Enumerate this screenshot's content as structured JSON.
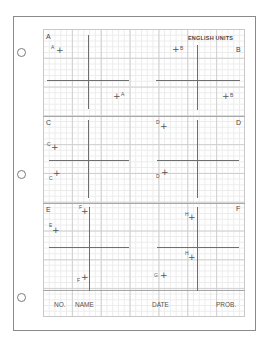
{
  "sheet": {
    "units_label": "ENGLISH UNITS",
    "panels": [
      {
        "id": "A",
        "label": "A",
        "points": [
          {
            "label": "A",
            "side": "left"
          },
          {
            "label": "A",
            "side": "right"
          }
        ]
      },
      {
        "id": "B",
        "label": "B",
        "points": [
          {
            "label": "B",
            "side": "right"
          },
          {
            "label": "B",
            "side": "right"
          }
        ]
      },
      {
        "id": "C",
        "label": "C",
        "points": [
          {
            "label": "C",
            "side": "left"
          },
          {
            "label": "C",
            "side": "left"
          }
        ]
      },
      {
        "id": "D",
        "label": "D",
        "points": [
          {
            "label": "D",
            "side": "left"
          },
          {
            "label": "D",
            "side": "left"
          }
        ]
      },
      {
        "id": "E",
        "label": "E",
        "points": [
          {
            "label": "E",
            "side": "left"
          },
          {
            "label": "F",
            "side": "left"
          },
          {
            "label": "F",
            "side": "left"
          }
        ]
      },
      {
        "id": "F",
        "label": "F",
        "points": [
          {
            "label": "H",
            "side": "left"
          },
          {
            "label": "H",
            "side": "left"
          },
          {
            "label": "G",
            "side": "left"
          }
        ]
      }
    ],
    "footer": {
      "no": "NO.",
      "name": "NAME",
      "date": "DATE",
      "prob": "PROB."
    },
    "colors": {
      "grid_major": "#cfcfcf",
      "grid_minor": "#ececec",
      "axis": "#6e6e6e",
      "border": "#8a8a8a"
    }
  }
}
